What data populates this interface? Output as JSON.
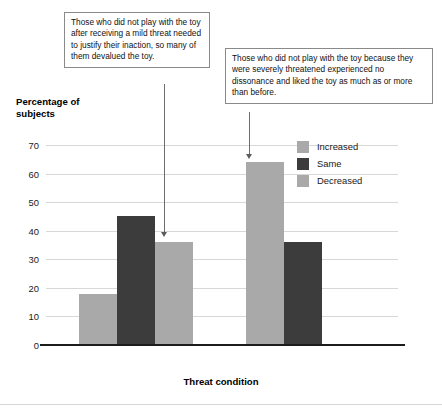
{
  "chart_data": {
    "type": "bar",
    "title": "",
    "xlabel": "Threat condition",
    "ylabel": "Percentage of subjects",
    "categories": [
      "Mild threat",
      "Severe threat"
    ],
    "series": [
      {
        "name": "Increased",
        "color": "#a9a9a9",
        "values": [
          18,
          64
        ]
      },
      {
        "name": "Same",
        "color": "#3c3c3c",
        "values": [
          45,
          36
        ]
      },
      {
        "name": "Decreased",
        "color": "#a9a9a9",
        "values": [
          36,
          null
        ]
      }
    ],
    "ylim": [
      0,
      70
    ],
    "yticks": [
      0,
      10,
      20,
      30,
      40,
      50,
      60,
      70
    ],
    "ytick_labels": [
      "0",
      "10",
      "20",
      "30",
      "40",
      "50",
      "60",
      "70"
    ],
    "grid": true,
    "legend_position": "upper-right",
    "annotations": [
      {
        "name": "mild-threat-callout",
        "text": "Those who did not play with the toy after receiving a mild threat needed to justify their inaction, so many of them devalued the toy.",
        "points_to": "Mild threat / Decreased"
      },
      {
        "name": "severe-threat-callout",
        "text": "Those who did not play with the toy because they were severely threatened experienced no dissonance and liked the toy as much as or more than before.",
        "points_to": "Severe threat / Increased"
      }
    ]
  },
  "axis": {
    "y_title_line1": "Percentage of",
    "y_title_line2": "subjects",
    "x_title": "Threat condition"
  },
  "colors": {
    "bar_light": "#a9a9a9",
    "bar_dark": "#3c3c3c",
    "gridline": "#d8d8d8",
    "axis": "#1c1c1c",
    "callout_border": "#8a8a8a",
    "leader_line": "#6e6e6e"
  }
}
